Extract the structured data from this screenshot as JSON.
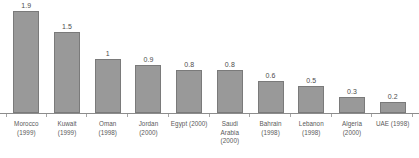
{
  "chart_data": {
    "type": "bar",
    "title": "",
    "subtitle": "",
    "xlabel": "",
    "ylabel": "",
    "ylim": [
      0,
      1.9
    ],
    "grid": false,
    "legend": false,
    "legend_position": "none",
    "orientation": "vertical",
    "categories": [
      "Morocco (1999)",
      "Kuwait (1999)",
      "Oman (1998)",
      "Jordan (2000)",
      "Egypt (2000)",
      "Saudi Arabia (2000)",
      "Bahrain (1998)",
      "Lebanon (1998)",
      "Algeria (2000)",
      "UAE (1998)"
    ],
    "values": [
      1.9,
      1.5,
      1,
      0.9,
      0.8,
      0.8,
      0.6,
      0.5,
      0.3,
      0.2
    ],
    "value_labels": [
      "1.9",
      "1.5",
      "1",
      "0.9",
      "0.8",
      "0.8",
      "0.6",
      "0.5",
      "0.3",
      "0.2"
    ],
    "bars": [
      {
        "value_label": "1.9",
        "value": 1.9,
        "label_lines": [
          "Morocco",
          "(1999)"
        ]
      },
      {
        "value_label": "1.5",
        "value": 1.5,
        "label_lines": [
          "Kuwait",
          "(1999)"
        ]
      },
      {
        "value_label": "1",
        "value": 1,
        "label_lines": [
          "Oman",
          "(1998)"
        ]
      },
      {
        "value_label": "0.9",
        "value": 0.9,
        "label_lines": [
          "Jordan",
          "(2000)"
        ]
      },
      {
        "value_label": "0.8",
        "value": 0.8,
        "label_lines": [
          "Egypt (2000)"
        ]
      },
      {
        "value_label": "0.8",
        "value": 0.8,
        "label_lines": [
          "Saudi",
          "Arabia",
          "(2000)"
        ]
      },
      {
        "value_label": "0.6",
        "value": 0.6,
        "label_lines": [
          "Bahrain",
          "(1998)"
        ]
      },
      {
        "value_label": "0.5",
        "value": 0.5,
        "label_lines": [
          "Lebanon",
          "(1998)"
        ]
      },
      {
        "value_label": "0.3",
        "value": 0.3,
        "label_lines": [
          "Algeria",
          "(2000)"
        ]
      },
      {
        "value_label": "0.2",
        "value": 0.2,
        "label_lines": [
          "UAE (1998)"
        ]
      }
    ],
    "colors": {
      "bar_fill": "#999999",
      "bar_outline": "#7a7a7a",
      "axis_line": "#8c8c8c",
      "tick": "#a6a6a6",
      "value_label_text": "#4d4d4d",
      "category_label_text": "#595959",
      "background": "#ffffff"
    }
  }
}
